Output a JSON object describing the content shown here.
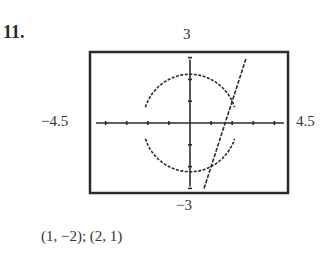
{
  "problem": {
    "number": "11."
  },
  "window": {
    "ymax_label": "3",
    "xmin_label": "−4.5",
    "xmax_label": "4.5",
    "ymin_label": "−3"
  },
  "answer": {
    "text": "(1, −2); (2, 1)"
  },
  "chart_data": {
    "type": "line",
    "title": "",
    "xlabel": "",
    "ylabel": "",
    "xlim": [
      -4.5,
      4.5
    ],
    "ylim": [
      -3,
      3
    ],
    "grid": false,
    "x_tick_step": 1,
    "y_tick_step": 1,
    "tick_labels": {
      "top": "3",
      "bottom": "-3",
      "left": "-4.5",
      "right": "4.5"
    },
    "series": [
      {
        "name": "circle",
        "equation": "x^2 + y^2 = 5",
        "style": "dotted",
        "radius": 2.236
      },
      {
        "name": "line",
        "equation": "y = 3x - 5",
        "style": "dotted",
        "points": [
          [
            0.667,
            -3
          ],
          [
            2.667,
            3
          ]
        ]
      }
    ],
    "intersections": [
      [
        1,
        -2
      ],
      [
        2,
        1
      ]
    ],
    "annotations": [
      "(1, -2); (2, 1)"
    ],
    "colors": {
      "ink": "#2a2a2a",
      "background": "#ffffff"
    }
  }
}
